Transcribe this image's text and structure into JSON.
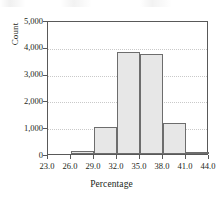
{
  "chart_data": {
    "type": "bar",
    "title": "",
    "subtitle": "",
    "xlabel": "Percentage",
    "ylabel": "Count",
    "grid": true,
    "legend": false,
    "legend_position": "none",
    "bin_width": 3,
    "bin_edges": [
      23.0,
      26.0,
      29.0,
      32.0,
      35.0,
      38.0,
      41.0,
      44.0
    ],
    "categories": [
      "23.0-26.0",
      "26.0-29.0",
      "29.0-32.0",
      "32.0-35.0",
      "35.0-38.0",
      "38.0-41.0",
      "41.0-44.0"
    ],
    "values": [
      0,
      100,
      1020,
      3820,
      3720,
      1160,
      80
    ],
    "x": [
      24.5,
      27.5,
      30.5,
      33.5,
      36.5,
      39.5,
      42.5
    ],
    "xlim": [
      23.0,
      44.0
    ],
    "ylim": [
      0,
      5000
    ],
    "xticks": [
      "23.0",
      "26.0",
      "29.0",
      "32.0",
      "35.0",
      "38.0",
      "41.0",
      "44.0"
    ],
    "xtick_values": [
      23.0,
      26.0,
      29.0,
      32.0,
      35.0,
      38.0,
      41.0,
      44.0
    ],
    "yticks": [
      "0",
      "1,000",
      "2,000",
      "3,000",
      "4,000",
      "5,000"
    ],
    "ytick_values": [
      0,
      1000,
      2000,
      3000,
      4000,
      5000
    ],
    "bar_fill_color": "#e7e7e7",
    "bar_edge_color": "#6d6d6d",
    "gridline_color": "#c9c9c9",
    "axis_color": "#595959",
    "background_color": "#ffffff",
    "text_color": "#231f20"
  }
}
